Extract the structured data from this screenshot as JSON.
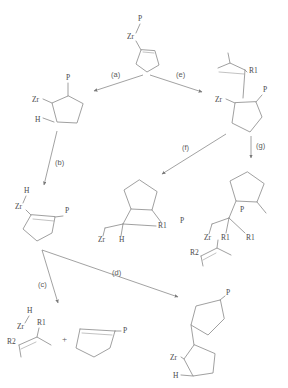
{
  "diagram": {
    "type": "reaction-scheme",
    "atom_labels": {
      "zr": "Zr",
      "p": "P",
      "h": "H",
      "r1": "R1",
      "r2": "R2",
      "plus": "+"
    },
    "steps": [
      {
        "id": "a",
        "label": "(a)",
        "from": "start-complex",
        "to": "structure-left-zr-h"
      },
      {
        "id": "b",
        "label": "(b)",
        "from": "structure-left-zr-h",
        "to": "structure-cyclopentene-p"
      },
      {
        "id": "c",
        "label": "(c)",
        "from": "structure-cyclopentene-p",
        "to": "structure-alkene-products"
      },
      {
        "id": "d",
        "label": "(d)",
        "from": "structure-cyclopentene-p",
        "to": "structure-bicyclic"
      },
      {
        "id": "e",
        "label": "(e)",
        "from": "start-complex",
        "to": "structure-right-alkene-r1"
      },
      {
        "id": "f",
        "label": "(f)",
        "from": "structure-right-alkene-r1",
        "to": "structure-center-r1"
      },
      {
        "id": "g",
        "label": "(g)",
        "from": "structure-right-alkene-r1",
        "to": "structure-right-r1-r1"
      }
    ],
    "structures": [
      {
        "id": "start-complex",
        "name": "zirconium-cyclopentene-complex",
        "labels": [
          "P",
          "Zr"
        ]
      },
      {
        "id": "structure-left-zr-h",
        "name": "zirconacyclopentane-hydride",
        "labels": [
          "P",
          "Zr",
          "H"
        ]
      },
      {
        "id": "structure-right-alkene-r1",
        "name": "alkenyl-zirconium-cyclopentane",
        "labels": [
          "R1",
          "Zr",
          "P"
        ]
      },
      {
        "id": "structure-cyclopentene-p",
        "name": "cyclopentene-phosphine-zirconium-hydride",
        "labels": [
          "H",
          "Zr",
          "P"
        ]
      },
      {
        "id": "structure-center-r1",
        "name": "cyclopentane-r1-zirconium",
        "labels": [
          "R1",
          "P",
          "Zr",
          "H"
        ]
      },
      {
        "id": "structure-right-r1-r1",
        "name": "cyclopentane-bis-r1-zirconium-alkene",
        "labels": [
          "P",
          "Zr",
          "R1",
          "R1",
          "R2"
        ]
      },
      {
        "id": "structure-alkene-products",
        "name": "alkene-zirconium-plus-cyclopentene",
        "labels": [
          "H",
          "Zr",
          "R1",
          "R2",
          "+",
          "P"
        ]
      },
      {
        "id": "structure-bicyclic",
        "name": "bicyclopentyl-phosphine-zirconium",
        "labels": [
          "P",
          "Zr",
          "H"
        ]
      }
    ],
    "colors": {
      "bond": "#8f8f8f",
      "text": "#4a4a4a",
      "arrow": "#8a8a8a",
      "background": "#ffffff"
    }
  }
}
